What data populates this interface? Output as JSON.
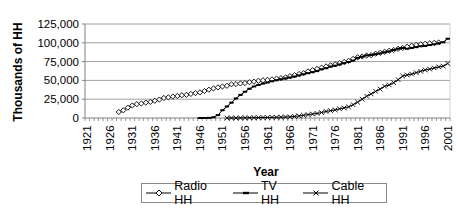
{
  "chart_data": {
    "type": "line",
    "title": "",
    "xlabel": "Year",
    "ylabel": "Thousands of HH",
    "ylim": [
      0,
      125000
    ],
    "yticks": [
      0,
      25000,
      50000,
      75000,
      100000,
      125000
    ],
    "ytick_labels": [
      "0",
      "25,000",
      "50,000",
      "75,000",
      "100,000",
      "125,000"
    ],
    "xtick_labels": [
      "1921",
      "1926",
      "1931",
      "1936",
      "1941",
      "1946",
      "1951",
      "1956",
      "1961",
      "1966",
      "1971",
      "1976",
      "1981",
      "1986",
      "1991",
      "1996",
      "2001"
    ],
    "x_range": [
      1921,
      2001
    ],
    "grid": "horizontal",
    "legend_position": "bottom",
    "series": [
      {
        "name": "Radio HH",
        "marker": "diamond-open",
        "x": [
          1928,
          1929,
          1930,
          1931,
          1932,
          1933,
          1934,
          1935,
          1936,
          1937,
          1938,
          1939,
          1940,
          1941,
          1942,
          1943,
          1944,
          1945,
          1946,
          1947,
          1948,
          1949,
          1950,
          1951,
          1952,
          1953,
          1954,
          1955,
          1956,
          1957,
          1958,
          1959,
          1960,
          1961,
          1962,
          1963,
          1964,
          1965,
          1966,
          1967,
          1968,
          1969,
          1970,
          1971,
          1972,
          1973,
          1974,
          1975,
          1976,
          1977,
          1978,
          1979,
          1980,
          1981,
          1982,
          1983,
          1984,
          1985,
          1986,
          1987,
          1988,
          1989,
          1990,
          1991,
          1992,
          1993,
          1994,
          1995,
          1996,
          1997,
          1998,
          1999
        ],
        "values": [
          8000,
          10250,
          13750,
          16700,
          18450,
          19250,
          20400,
          21450,
          22900,
          24500,
          26650,
          27500,
          28500,
          29300,
          30300,
          30800,
          32000,
          33100,
          33998,
          35900,
          37600,
          39300,
          40700,
          41900,
          42800,
          44800,
          45100,
          45900,
          46500,
          47600,
          48300,
          49500,
          50200,
          50700,
          51300,
          52300,
          53000,
          54000,
          55700,
          57000,
          58500,
          59600,
          62000,
          63600,
          65400,
          67000,
          68700,
          70000,
          71400,
          72900,
          74500,
          76000,
          78600,
          80700,
          81800,
          83100,
          83600,
          85500,
          86700,
          88000,
          89500,
          90400,
          92000,
          93100,
          94800,
          96000,
          97300,
          98000,
          98600,
          99300,
          99900,
          100400
        ]
      },
      {
        "name": "TV HH",
        "marker": "dash",
        "x": [
          1946,
          1947,
          1948,
          1949,
          1950,
          1951,
          1952,
          1953,
          1954,
          1955,
          1956,
          1957,
          1958,
          1959,
          1960,
          1961,
          1962,
          1963,
          1964,
          1965,
          1966,
          1967,
          1968,
          1969,
          1970,
          1971,
          1972,
          1973,
          1974,
          1975,
          1976,
          1977,
          1978,
          1979,
          1980,
          1981,
          1982,
          1983,
          1984,
          1985,
          1986,
          1987,
          1988,
          1989,
          1990,
          1991,
          1992,
          1993,
          1994,
          1995,
          1996,
          1997,
          1998,
          1999,
          2000,
          2001
        ],
        "values": [
          8,
          14,
          172,
          940,
          3875,
          10320,
          15300,
          20400,
          26000,
          30700,
          34900,
          38900,
          41924,
          43950,
          45750,
          47200,
          48855,
          50300,
          51600,
          52700,
          53850,
          55130,
          56670,
          58250,
          59550,
          60900,
          62350,
          64800,
          66200,
          68500,
          69600,
          71200,
          72900,
          74500,
          76300,
          79900,
          81500,
          83300,
          83800,
          84900,
          85900,
          87400,
          88600,
          90400,
          92100,
          93100,
          92100,
          93100,
          94200,
          95400,
          95900,
          97000,
          98000,
          99400,
          100800,
          105400
        ]
      },
      {
        "name": "Cable HH",
        "marker": "x",
        "x": [
          1952,
          1953,
          1954,
          1955,
          1956,
          1957,
          1958,
          1959,
          1960,
          1961,
          1962,
          1963,
          1964,
          1965,
          1966,
          1967,
          1968,
          1969,
          1970,
          1971,
          1972,
          1973,
          1974,
          1975,
          1976,
          1977,
          1978,
          1979,
          1980,
          1981,
          1982,
          1983,
          1984,
          1985,
          1986,
          1987,
          1988,
          1989,
          1990,
          1991,
          1992,
          1993,
          1994,
          1995,
          1996,
          1997,
          1998,
          1999,
          2000,
          2001
        ],
        "values": [
          14,
          30,
          65,
          150,
          300,
          350,
          450,
          550,
          650,
          725,
          850,
          950,
          1085,
          1275,
          1575,
          2100,
          2800,
          3600,
          4500,
          5300,
          6000,
          7300,
          8700,
          9800,
          10800,
          12200,
          13400,
          14800,
          17700,
          21000,
          25000,
          29000,
          32000,
          35400,
          38400,
          42200,
          44000,
          47000,
          51000,
          55800,
          57200,
          58400,
          60300,
          62100,
          63900,
          65000,
          66500,
          67900,
          69000,
          72500
        ]
      }
    ]
  },
  "legend": {
    "items": [
      {
        "label": "Radio HH",
        "marker": "diamond-open"
      },
      {
        "label": "TV HH",
        "marker": "dash"
      },
      {
        "label": "Cable HH",
        "marker": "x"
      }
    ]
  },
  "colors": {
    "line": "#000000",
    "grid": "#a0a0a0",
    "axis": "#808080"
  }
}
